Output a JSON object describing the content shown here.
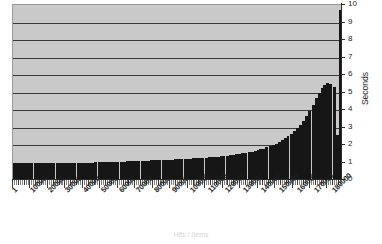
{
  "chart_data": {
    "type": "bar",
    "title": "",
    "subtitle": "",
    "xlabel": "Hits / Items",
    "ylabel": "Seconds",
    "ylim": [
      0,
      10
    ],
    "ytick_values": [
      0,
      1,
      2,
      3,
      4,
      5,
      6,
      7,
      8,
      9,
      10
    ],
    "ytick_labels": [
      "0",
      "1",
      "2",
      "3",
      "4",
      "5",
      "6",
      "7",
      "8",
      "9",
      "10"
    ],
    "grid": true,
    "grid_axis": "y",
    "legend": "none",
    "xtick_labels": [
      "1",
      "10000",
      "20000",
      "30000",
      "40000",
      "50000",
      "60000",
      "70000",
      "80000",
      "90000",
      "100000",
      "110000",
      "120000",
      "130000",
      "140000",
      "150000",
      "160000",
      "170000",
      "180000"
    ],
    "xtick_positions": [
      1,
      10000,
      20000,
      30000,
      40000,
      50000,
      60000,
      70000,
      80000,
      90000,
      100000,
      110000,
      120000,
      130000,
      140000,
      150000,
      160000,
      170000,
      180000
    ],
    "x_range": [
      1,
      185000
    ],
    "bar_color": "#161616",
    "plot_background": "#c9c9c9",
    "grid_color": "#3a3a3a",
    "axis_color": "#2a2a2a",
    "note": "Flat near 1 second across most of the range, then exponential rise after ~150000 to about 5.5 s, with a single final spike near 9.7 s.",
    "x": [
      1,
      1800,
      3600,
      5400,
      7200,
      9000,
      10800,
      12600,
      14400,
      16200,
      18000,
      19800,
      21600,
      23400,
      25200,
      27000,
      28800,
      30600,
      32400,
      34200,
      36000,
      37800,
      39600,
      41400,
      43200,
      45000,
      46800,
      48600,
      50400,
      52200,
      54000,
      55800,
      57600,
      59400,
      61200,
      63000,
      64800,
      66600,
      68400,
      70200,
      72000,
      73800,
      75600,
      77400,
      79200,
      81000,
      82800,
      84600,
      86400,
      88200,
      90000,
      91800,
      93600,
      95400,
      97200,
      99000,
      100800,
      102600,
      104400,
      106200,
      108000,
      109800,
      111600,
      113400,
      115200,
      117000,
      118800,
      120600,
      122400,
      124200,
      126000,
      127800,
      129600,
      131400,
      133200,
      135000,
      136800,
      138600,
      140400,
      142200,
      144000,
      145800,
      147600,
      149400,
      151200,
      153000,
      154800,
      156600,
      158400,
      160200,
      162000,
      163800,
      165600,
      167400,
      169200,
      171000,
      172800,
      174600,
      176400,
      178200,
      179100,
      180000,
      180900,
      181800,
      182700,
      183600,
      184500,
      185000
    ],
    "values": [
      1.0,
      1.0,
      1.0,
      1.0,
      1.0,
      1.0,
      1.0,
      1.0,
      1.0,
      1.0,
      1.0,
      1.0,
      1.0,
      1.0,
      1.0,
      1.0,
      1.0,
      1.0,
      1.0,
      1.0,
      1.0,
      1.0,
      1.0,
      1.0,
      1.0,
      1.0,
      1.0,
      1.02,
      1.02,
      1.02,
      1.02,
      1.02,
      1.04,
      1.04,
      1.04,
      1.05,
      1.05,
      1.06,
      1.06,
      1.08,
      1.08,
      1.09,
      1.1,
      1.1,
      1.11,
      1.12,
      1.12,
      1.13,
      1.14,
      1.15,
      1.15,
      1.16,
      1.17,
      1.18,
      1.19,
      1.2,
      1.2,
      1.21,
      1.22,
      1.23,
      1.24,
      1.25,
      1.27,
      1.28,
      1.29,
      1.31,
      1.33,
      1.34,
      1.36,
      1.38,
      1.4,
      1.42,
      1.44,
      1.46,
      1.49,
      1.52,
      1.55,
      1.58,
      1.62,
      1.66,
      1.7,
      1.75,
      1.8,
      1.86,
      1.93,
      2.0,
      2.08,
      2.17,
      2.27,
      2.38,
      2.5,
      2.63,
      2.78,
      2.95,
      3.15,
      3.38,
      3.65,
      3.95,
      4.3,
      4.7,
      5.0,
      5.25,
      5.45,
      5.55,
      5.5,
      5.3,
      2.6,
      9.7
    ]
  },
  "axes": {
    "right_title": "Seconds",
    "bottom_title": "Hits / Items"
  }
}
